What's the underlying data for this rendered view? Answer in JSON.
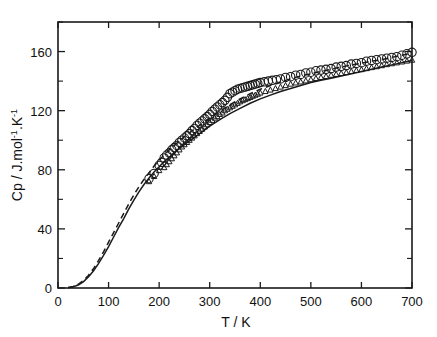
{
  "chart_data": {
    "type": "scatter",
    "title": "",
    "xlabel": "T / K",
    "ylabel": "Cp / J.mol-1.K-1",
    "ylabel_parts": {
      "lead": "Cp / J.mol",
      "sup1": "-1",
      "mid": ".K",
      "sup2": "-1"
    },
    "xlim": [
      0,
      700
    ],
    "ylim": [
      0,
      180
    ],
    "xticks": [
      0,
      100,
      200,
      300,
      400,
      500,
      600,
      700
    ],
    "xticklabels": [
      "0",
      "100",
      "200",
      "300",
      "400",
      "500",
      "600",
      "700"
    ],
    "yticks": [
      0,
      40,
      80,
      120,
      160
    ],
    "yticklabels": [
      "0",
      "40",
      "80",
      "120",
      "160"
    ],
    "yminorticks": [
      20,
      60,
      100,
      140,
      180
    ],
    "grid": false,
    "legend": "none",
    "frame": "box",
    "series": [
      {
        "name": "upper-series",
        "marker": "open-circle",
        "marker_size": 4.2,
        "line": "dashed",
        "x": [
          180,
          190,
          200,
          205,
          210,
          215,
          220,
          225,
          230,
          235,
          240,
          245,
          250,
          255,
          260,
          265,
          270,
          275,
          280,
          285,
          290,
          295,
          300,
          305,
          310,
          315,
          320,
          325,
          330,
          335,
          340,
          345,
          350,
          355,
          360,
          365,
          370,
          375,
          380,
          385,
          390,
          395,
          400,
          408,
          416,
          424,
          432,
          440,
          450,
          460,
          470,
          480,
          490,
          500,
          510,
          520,
          530,
          540,
          550,
          560,
          570,
          580,
          590,
          600,
          610,
          620,
          630,
          640,
          650,
          660,
          670,
          680,
          690,
          700
        ],
        "y": [
          74.0,
          77.5,
          83.0,
          85.0,
          88.0,
          90.0,
          91.5,
          93.5,
          95.0,
          96.5,
          98.5,
          100.0,
          101.5,
          103.0,
          104.5,
          106.5,
          108.0,
          110.0,
          111.5,
          113.0,
          114.5,
          116.0,
          117.5,
          119.5,
          121.0,
          122.5,
          124.0,
          125.5,
          127.0,
          129.0,
          131.5,
          132.5,
          133.5,
          134.5,
          135.0,
          135.5,
          136.0,
          136.5,
          137.0,
          137.5,
          138.0,
          138.5,
          139.0,
          139.5,
          140.0,
          140.5,
          141.0,
          141.5,
          142.5,
          143.0,
          144.0,
          144.5,
          145.5,
          146.0,
          147.0,
          147.5,
          148.0,
          148.5,
          149.5,
          150.0,
          150.5,
          151.5,
          152.0,
          152.5,
          153.5,
          154.0,
          154.5,
          155.0,
          155.5,
          156.0,
          156.5,
          157.5,
          158.5,
          159.5
        ]
      },
      {
        "name": "lower-series",
        "marker": "open-triangle",
        "marker_size": 3.0,
        "line": "solid",
        "x": [
          180,
          190,
          200,
          210,
          215,
          220,
          225,
          230,
          235,
          240,
          245,
          250,
          255,
          260,
          265,
          270,
          275,
          280,
          285,
          290,
          295,
          300,
          305,
          310,
          315,
          320,
          325,
          330,
          335,
          340,
          345,
          350,
          355,
          360,
          365,
          370,
          375,
          380,
          385,
          390,
          395,
          400,
          410,
          420,
          430,
          440,
          450,
          460,
          470,
          480,
          490,
          500,
          510,
          520,
          530,
          540,
          550,
          560,
          570,
          580,
          590,
          600,
          610,
          620,
          630,
          640,
          650,
          660,
          670,
          680,
          690,
          700
        ],
        "y": [
          72.0,
          75.5,
          79.5,
          81.5,
          83.5,
          85.5,
          87.5,
          89.5,
          91.5,
          93.5,
          95.5,
          97.0,
          98.5,
          100.0,
          101.5,
          103.0,
          104.5,
          106.0,
          107.5,
          109.0,
          110.5,
          112.0,
          113.5,
          115.0,
          116.0,
          117.5,
          118.5,
          120.0,
          121.0,
          122.0,
          123.0,
          124.0,
          125.0,
          126.0,
          126.8,
          127.5,
          128.2,
          129.0,
          129.8,
          130.5,
          131.2,
          132.0,
          133.0,
          134.0,
          135.0,
          136.0,
          137.0,
          138.0,
          138.8,
          139.5,
          140.2,
          141.0,
          141.8,
          142.5,
          143.2,
          144.0,
          144.6,
          145.2,
          145.8,
          146.5,
          147.2,
          147.8,
          148.5,
          149.2,
          149.8,
          150.5,
          151.2,
          151.8,
          152.4,
          153.0,
          153.6,
          154.2
        ]
      }
    ],
    "fit_curves": [
      {
        "name": "upper-fit",
        "style": "dashed",
        "x": [
          20,
          30,
          40,
          50,
          60,
          70,
          80,
          90,
          100,
          110,
          120,
          130,
          140,
          150,
          160,
          170,
          180,
          190,
          200,
          210,
          220,
          230,
          240,
          250,
          260,
          270,
          280,
          290,
          300,
          320,
          340,
          360,
          380,
          400,
          420,
          440,
          460,
          480,
          500,
          520,
          540,
          560,
          580,
          600,
          620,
          640,
          660,
          680,
          700
        ],
        "y": [
          0.3,
          1.0,
          2.5,
          5.0,
          8.5,
          13.0,
          18.5,
          24.5,
          31.0,
          37.5,
          44.0,
          50.5,
          57.0,
          63.0,
          68.5,
          73.5,
          78.0,
          82.5,
          86.5,
          90.0,
          93.5,
          96.5,
          99.5,
          102.5,
          105.0,
          107.5,
          110.0,
          112.5,
          115.0,
          119.5,
          124.0,
          128.0,
          131.5,
          134.5,
          137.0,
          139.5,
          141.5,
          143.5,
          145.0,
          146.5,
          148.0,
          149.5,
          151.0,
          152.0,
          153.5,
          154.5,
          156.0,
          157.5,
          159.0
        ]
      },
      {
        "name": "lower-fit",
        "style": "solid",
        "x": [
          20,
          30,
          40,
          50,
          60,
          70,
          80,
          90,
          100,
          110,
          120,
          130,
          140,
          150,
          160,
          170,
          180,
          190,
          200,
          210,
          220,
          230,
          240,
          250,
          260,
          270,
          280,
          290,
          300,
          320,
          340,
          360,
          380,
          400,
          420,
          440,
          460,
          480,
          500,
          520,
          540,
          560,
          580,
          600,
          620,
          640,
          660,
          680,
          700
        ],
        "y": [
          0.2,
          0.8,
          2.0,
          4.2,
          7.5,
          11.5,
          16.5,
          22.0,
          28.0,
          34.5,
          41.0,
          47.0,
          53.5,
          59.5,
          65.0,
          70.0,
          74.5,
          78.5,
          82.0,
          85.5,
          88.5,
          91.5,
          94.5,
          97.0,
          99.5,
          102.0,
          104.5,
          107.0,
          109.5,
          114.0,
          118.0,
          121.5,
          125.0,
          128.0,
          130.5,
          133.0,
          135.0,
          137.0,
          139.0,
          140.5,
          142.0,
          143.5,
          145.0,
          146.5,
          148.0,
          149.5,
          151.0,
          152.5,
          154.0
        ]
      }
    ]
  }
}
